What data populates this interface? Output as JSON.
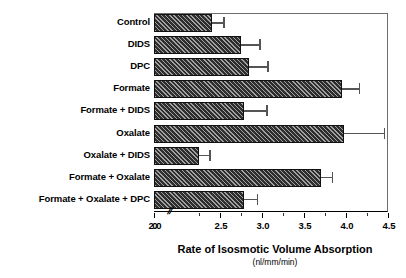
{
  "chart_data": {
    "type": "bar",
    "orientation": "horizontal",
    "title": "",
    "xlabel": "Rate of Isosmotic Volume Absorption",
    "xunits": "(nl/mm/min)",
    "ylabel": "",
    "xlim": [
      2.0,
      4.5
    ],
    "axis_break": true,
    "axis_break_symbol": "//",
    "grid": false,
    "legend": "none",
    "xticks": [
      0,
      2.0,
      2.5,
      3.0,
      3.5,
      4.0,
      4.5
    ],
    "xticklabels": [
      "0",
      "2.0",
      "2.5",
      "3.0",
      "3.5",
      "4.0",
      "4.5"
    ],
    "minor_ticks": [
      2.25,
      2.75,
      3.25,
      3.75,
      4.25
    ],
    "categories": [
      "Control",
      "DIDS",
      "DPC",
      "Formate",
      "Formate + DIDS",
      "Oxalate",
      "Oxalate + DIDS",
      "Formate + Oxalate",
      "Formate + Oxalate + DPC"
    ],
    "values": [
      2.4,
      2.75,
      2.85,
      3.95,
      2.78,
      3.98,
      2.25,
      3.7,
      2.78
    ],
    "errors": [
      0.14,
      0.22,
      0.21,
      0.2,
      0.27,
      0.47,
      0.12,
      0.13,
      0.16
    ],
    "bar_color": "#2e2e2e",
    "bar_hatch": "diagonal",
    "errorbar_color": "#555555"
  }
}
